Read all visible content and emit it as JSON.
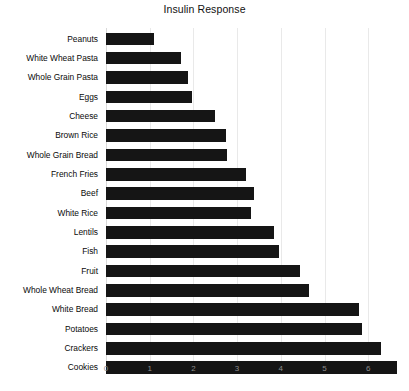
{
  "chart_data": {
    "type": "bar",
    "orientation": "horizontal",
    "title": "Insulin Response",
    "xlabel": "",
    "ylabel": "",
    "xlim": [
      0,
      6.9
    ],
    "xticks": [
      0,
      1,
      2,
      3,
      4,
      5,
      6
    ],
    "xtick_labels": [
      "0",
      "1",
      "2",
      "3",
      "4",
      "5",
      "6"
    ],
    "grid": true,
    "grid_axis": "x",
    "legend": false,
    "bar_color": "#151515",
    "grid_color": "#e9e9e9",
    "background_color": "#ffffff",
    "categories": [
      "Peanuts",
      "White Wheat Pasta",
      "Whole Grain Pasta",
      "Eggs",
      "Cheese",
      "Brown Rice",
      "Whole Grain Bread",
      "French Fries",
      "Beef",
      "White Rice",
      "Lentils",
      "Fish",
      "Fruit",
      "Whole Wheat Bread",
      "White Bread",
      "Potatoes",
      "Crackers",
      "Cookies"
    ],
    "values": [
      1.1,
      1.72,
      1.88,
      1.97,
      2.5,
      2.75,
      2.78,
      3.2,
      3.38,
      3.32,
      3.85,
      3.95,
      4.45,
      4.65,
      5.8,
      5.85,
      6.3,
      6.65
    ]
  }
}
